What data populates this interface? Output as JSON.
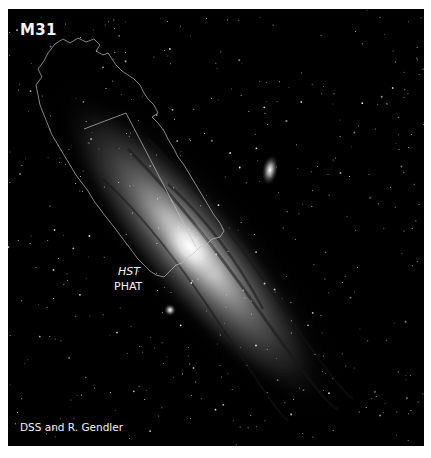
{
  "figure": {
    "title": "M31",
    "footprint_label": {
      "line1": "HST",
      "line2": "PHAT"
    },
    "credit": "DSS and R. Gendler",
    "colors": {
      "background": "#000000",
      "border": "#ffffff",
      "text": "#f2f2f2",
      "footprint_outline": "#bfbfbf"
    },
    "scene": {
      "subject": "Andromeda Galaxy (M31) grayscale photograph",
      "overlay": "HST PHAT survey footprint outline",
      "satellites": [
        "M32",
        "M110"
      ]
    }
  }
}
